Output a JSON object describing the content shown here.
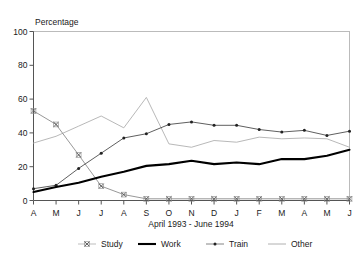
{
  "chart_data": {
    "type": "line",
    "title": "",
    "xlabel": "April 1993 - June 1994",
    "ylabel": "Percentage",
    "ylim": [
      0,
      100
    ],
    "yticks": [
      0,
      20,
      40,
      60,
      80,
      100
    ],
    "grid": false,
    "legend_position": "bottom",
    "categories": [
      "A",
      "M",
      "J",
      "J",
      "A",
      "S",
      "O",
      "N",
      "D",
      "J",
      "F",
      "M",
      "A",
      "M",
      "J"
    ],
    "series": [
      {
        "name": "Study",
        "marker": "x",
        "line_color": "#8c8c8c",
        "values": [
          53,
          45,
          27,
          8.5,
          3.5,
          1,
          1,
          1,
          1,
          1,
          1,
          1,
          1,
          1,
          1
        ]
      },
      {
        "name": "Work",
        "marker": "none",
        "line_color": "#000000",
        "values": [
          5,
          8,
          10.5,
          14,
          17,
          20.5,
          21.5,
          23.5,
          21.5,
          22.5,
          21.5,
          24.5,
          24.5,
          26.5,
          30
        ]
      },
      {
        "name": "Train",
        "marker": "dot",
        "line_color": "#4d4d4d",
        "values": [
          7,
          9,
          19,
          28,
          37,
          39.5,
          45,
          46.5,
          44.5,
          44.5,
          42,
          40.5,
          41.5,
          38.5,
          41
        ]
      },
      {
        "name": "Other",
        "marker": "none",
        "line_color": "#b0b0b0",
        "values": [
          34,
          38,
          44,
          50,
          43,
          61,
          33.5,
          31.5,
          35.5,
          34.5,
          37.5,
          36.5,
          37,
          36.5,
          31.5
        ]
      }
    ]
  },
  "axis": {
    "y_tick_labels": [
      "0",
      "20",
      "40",
      "60",
      "80",
      "100"
    ],
    "x_tick_labels": [
      "A",
      "M",
      "J",
      "J",
      "A",
      "S",
      "O",
      "N",
      "D",
      "J",
      "F",
      "M",
      "A",
      "M",
      "J"
    ],
    "y_axis_title": "Percentage",
    "x_axis_title": "April 1993 - June 1994"
  },
  "legend": {
    "items": [
      {
        "label": "Study",
        "marker": "x",
        "color": "#8c8c8c"
      },
      {
        "label": "Work",
        "marker": "none",
        "color": "#000000"
      },
      {
        "label": "Train",
        "marker": "dot",
        "color": "#4d4d4d"
      },
      {
        "label": "Other",
        "marker": "none",
        "color": "#b0b0b0"
      }
    ]
  }
}
